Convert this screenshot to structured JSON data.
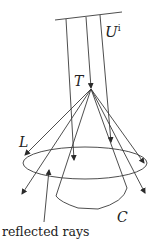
{
  "figure": {
    "labels": {
      "incident_field": "U",
      "incident_field_sup": "i",
      "apex": "T",
      "ring": "L",
      "cone": "C",
      "caption_arrow": "reflected rays"
    },
    "colors": {
      "line": "#3a3a3a",
      "text": "#222222",
      "background": "#ffffff"
    }
  }
}
